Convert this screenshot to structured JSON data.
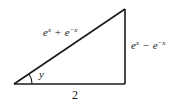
{
  "diagram": {
    "type": "right-triangle",
    "vertices": {
      "bottom_left": [
        14,
        84
      ],
      "bottom_right": [
        125,
        84
      ],
      "top_right": [
        125,
        9
      ]
    },
    "stroke_color": "#1a1a1a",
    "labels": {
      "hypotenuse": {
        "base1": "e",
        "exp1": "x",
        "operator": "+",
        "base2": "e",
        "exp2": "−x",
        "full_text": "e^x + e^{-x}"
      },
      "opposite": {
        "base1": "e",
        "exp1": "x",
        "operator": "−",
        "base2": "e",
        "exp2": "−x",
        "full_text": "e^x − e^{-x}"
      },
      "adjacent": "2",
      "angle": "y"
    }
  }
}
